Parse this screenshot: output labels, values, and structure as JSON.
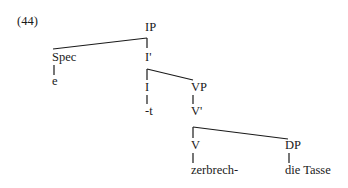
{
  "example_number": "(44)",
  "tree": {
    "root": "IP",
    "nodes": {
      "ip": "IP",
      "spec": "Spec",
      "spec_leaf": "e",
      "i_bar": "I'",
      "i": "I",
      "i_leaf": "-t",
      "vp": "VP",
      "v_bar": "V'",
      "v": "V",
      "v_leaf": "zerbrech-",
      "dp": "DP",
      "dp_leaf": "die Tasse"
    },
    "edges": [
      [
        "IP",
        "Spec"
      ],
      [
        "IP",
        "I'"
      ],
      [
        "Spec",
        "e"
      ],
      [
        "I'",
        "I"
      ],
      [
        "I'",
        "VP"
      ],
      [
        "I",
        "-t"
      ],
      [
        "VP",
        "V'"
      ],
      [
        "V'",
        "V"
      ],
      [
        "V'",
        "DP"
      ],
      [
        "V",
        "zerbrech-"
      ],
      [
        "DP",
        "die Tasse"
      ]
    ]
  }
}
